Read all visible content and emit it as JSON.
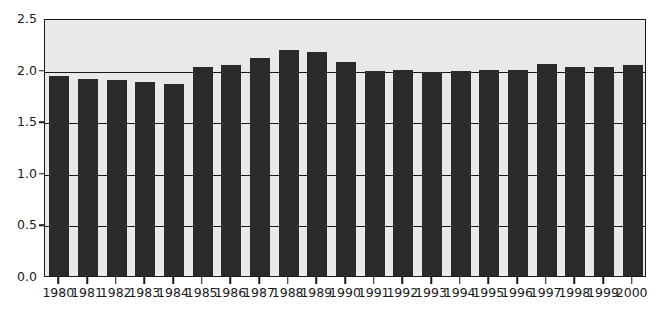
{
  "chart_data": {
    "type": "bar",
    "title": "",
    "subtitle": "",
    "xlabel": "",
    "ylabel": "",
    "categories": [
      "1980",
      "1981",
      "1982",
      "1983",
      "1984",
      "1985",
      "1986",
      "1987",
      "1988",
      "1989",
      "1990",
      "1991",
      "1992",
      "1993",
      "1994",
      "1995",
      "1996",
      "1997",
      "1998",
      "1999",
      "2000"
    ],
    "values": [
      1.94,
      1.91,
      1.9,
      1.88,
      1.86,
      2.03,
      2.04,
      2.11,
      2.19,
      2.17,
      2.07,
      1.99,
      2.0,
      1.98,
      1.99,
      2.0,
      2.0,
      2.05,
      2.03,
      2.03,
      2.04
    ],
    "ylim": [
      0.0,
      2.5
    ],
    "yticks": [
      0.0,
      0.5,
      1.0,
      1.5,
      2.0,
      2.5
    ],
    "ytick_labels": [
      "0.0",
      "0.5",
      "1.0",
      "1.5",
      "2.0",
      "2.5"
    ],
    "grid": true,
    "legend": "none",
    "bar_color": "#2b2b2b",
    "plot_background": "#e9e9e9",
    "axis_color": "#1a1a1a",
    "page_background": "#ffffff"
  }
}
